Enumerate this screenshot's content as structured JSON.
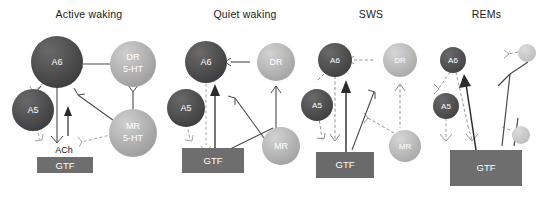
{
  "figure": {
    "width": 543,
    "height": 197,
    "background": "#ffffff",
    "type": "neural-circuit-diagram"
  },
  "colors": {
    "noradrenergic_dark": "#4d4d4d",
    "serotonergic_light": "#b3b3b3",
    "serotonergic_mid": "#9e9e9e",
    "faded_circle": "#c9c9c9",
    "gtf_box": "#6e6e6e",
    "gtf_box_dark": "#6a6a6a",
    "line": "#4a4a4a",
    "line_faint": "#9a9a9a",
    "text_dark": "#1a1a1a",
    "text_light": "#ffffff"
  },
  "panels": [
    {
      "id": "active-waking",
      "title": "Active waking",
      "nodes": [
        {
          "name": "A6",
          "label": "A6",
          "label2": "",
          "shade": "dark",
          "size": "large"
        },
        {
          "name": "A5",
          "label": "A5",
          "label2": "",
          "shade": "dark",
          "size": "medium"
        },
        {
          "name": "DR",
          "label": "DR",
          "label2": "5-HT",
          "shade": "light",
          "size": "large"
        },
        {
          "name": "MR",
          "label": "MR",
          "label2": "5-HT",
          "shade": "light",
          "size": "large"
        }
      ],
      "box": {
        "label": "GTF",
        "size": "small"
      },
      "free_labels": [
        {
          "text": "ACh"
        }
      ],
      "arrow_up": true
    },
    {
      "id": "quiet-waking",
      "title": "Quiet waking",
      "nodes": [
        {
          "name": "A6",
          "label": "A6",
          "label2": "",
          "shade": "dark",
          "size": "medium"
        },
        {
          "name": "A5",
          "label": "A5",
          "label2": "",
          "shade": "dark",
          "size": "medium"
        },
        {
          "name": "DR",
          "label": "DR",
          "label2": "",
          "shade": "light",
          "size": "medium"
        },
        {
          "name": "MR",
          "label": "MR",
          "label2": "",
          "shade": "light",
          "size": "medium"
        }
      ],
      "box": {
        "label": "GTF",
        "size": "medium"
      },
      "free_labels": [],
      "arrow_up": true
    },
    {
      "id": "sws",
      "title": "SWS",
      "nodes": [
        {
          "name": "A6",
          "label": "A6",
          "label2": "",
          "shade": "dark",
          "size": "small"
        },
        {
          "name": "A5",
          "label": "A5",
          "label2": "",
          "shade": "dark",
          "size": "small"
        },
        {
          "name": "DR",
          "label": "DR",
          "label2": "",
          "shade": "light",
          "size": "small"
        },
        {
          "name": "MR",
          "label": "MR",
          "label2": "",
          "shade": "light",
          "size": "small"
        }
      ],
      "box": {
        "label": "GTF",
        "size": "large"
      },
      "free_labels": [],
      "arrow_up": true
    },
    {
      "id": "rems",
      "title": "REMs",
      "nodes": [
        {
          "name": "A6",
          "label": "A6",
          "label2": "",
          "shade": "dark",
          "size": "tiny"
        },
        {
          "name": "A5",
          "label": "A5",
          "label2": "",
          "shade": "dark",
          "size": "tiny"
        },
        {
          "name": "DR",
          "label": "",
          "label2": "",
          "shade": "faded",
          "size": "tiny"
        },
        {
          "name": "MR",
          "label": "",
          "label2": "",
          "shade": "faded",
          "size": "tiny"
        }
      ],
      "box": {
        "label": "GTF",
        "size": "xlarge"
      },
      "free_labels": [],
      "arrow_up": true
    }
  ]
}
